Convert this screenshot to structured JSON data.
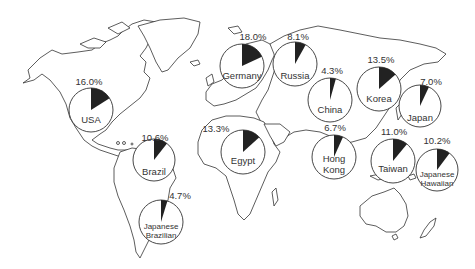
{
  "chart_data": {
    "type": "pie",
    "title": "",
    "colors": {
      "slice": "#222222",
      "background": "#ffffff",
      "outline": "#333333"
    },
    "series": [
      {
        "name": "USA",
        "label_lines": [
          "USA"
        ],
        "value": 16.0,
        "pct_label": "16.0%",
        "cx": 91,
        "cy": 110,
        "r": 22,
        "lx": 89,
        "ly": 85,
        "nx": 91,
        "ny": 123
      },
      {
        "name": "Germany",
        "label_lines": [
          "Germany"
        ],
        "value": 18.0,
        "pct_label": "18.0%",
        "cx": 242,
        "cy": 66,
        "r": 22,
        "lx": 253,
        "ly": 40,
        "nx": 242,
        "ny": 79
      },
      {
        "name": "Russia",
        "label_lines": [
          "Russia"
        ],
        "value": 8.1,
        "pct_label": "8.1%",
        "cx": 295,
        "cy": 64,
        "r": 22,
        "lx": 298,
        "ly": 40,
        "nx": 295,
        "ny": 79
      },
      {
        "name": "China",
        "label_lines": [
          "China"
        ],
        "value": 4.3,
        "pct_label": "4.3%",
        "cx": 330,
        "cy": 100,
        "r": 22,
        "lx": 332,
        "ly": 74,
        "nx": 330,
        "ny": 113
      },
      {
        "name": "Korea",
        "label_lines": [
          "Korea"
        ],
        "value": 13.5,
        "pct_label": "13.5%",
        "cx": 379,
        "cy": 89,
        "r": 22,
        "lx": 381,
        "ly": 63,
        "nx": 379,
        "ny": 102
      },
      {
        "name": "Japan",
        "label_lines": [
          "Japan"
        ],
        "value": 7.0,
        "pct_label": "7.0%",
        "cx": 420,
        "cy": 106,
        "r": 21,
        "lx": 431,
        "ly": 85,
        "nx": 420,
        "ny": 121
      },
      {
        "name": "Egypt",
        "label_lines": [
          "Egypt"
        ],
        "value": 13.3,
        "pct_label": "13.3%",
        "cx": 243,
        "cy": 152,
        "r": 22,
        "lx": 216,
        "ly": 132,
        "nx": 243,
        "ny": 164
      },
      {
        "name": "Hong Kong",
        "label_lines": [
          "Hong",
          "Kong"
        ],
        "value": 6.7,
        "pct_label": "6.7%",
        "cx": 334,
        "cy": 157,
        "r": 22,
        "lx": 335,
        "ly": 131,
        "nx": 334,
        "ny": 162
      },
      {
        "name": "Taiwan",
        "label_lines": [
          "Taiwan"
        ],
        "value": 11.0,
        "pct_label": "11.0%",
        "cx": 393,
        "cy": 161,
        "r": 22,
        "lx": 394,
        "ly": 135,
        "nx": 393,
        "ny": 172
      },
      {
        "name": "Japanese Hawaiian",
        "label_lines": [
          "Japanese",
          "Hawaiian"
        ],
        "value": 10.2,
        "pct_label": "10.2%",
        "cx": 437,
        "cy": 170,
        "r": 21,
        "lx": 437,
        "ly": 144,
        "nx": 437,
        "ny": 177
      },
      {
        "name": "Brazil",
        "label_lines": [
          "Brazil"
        ],
        "value": 10.6,
        "pct_label": "10.6%",
        "cx": 154,
        "cy": 160,
        "r": 21,
        "lx": 155,
        "ly": 141,
        "nx": 154,
        "ny": 175
      },
      {
        "name": "Japanese Brazilian",
        "label_lines": [
          "Japanese",
          "Brazilian"
        ],
        "value": 4.7,
        "pct_label": "4.7%",
        "cx": 161,
        "cy": 222,
        "r": 22,
        "lx": 180,
        "ly": 199,
        "nx": 161,
        "ny": 229
      }
    ],
    "xlabel": "",
    "ylabel": "",
    "legend": "none",
    "grid": false
  }
}
